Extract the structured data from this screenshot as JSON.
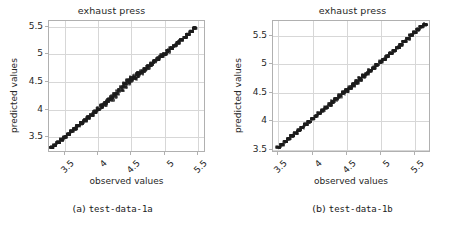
{
  "figure": {
    "background": "#ffffff",
    "panels": [
      {
        "id": "panel-a",
        "title": "exhaust press",
        "xlabel": "observed values",
        "ylabel": "predicted values",
        "caption_marker": "(a)",
        "caption_text": "test-data-1a",
        "xticks": [
          "3.5",
          "4.0",
          "4.5",
          "5.0",
          "5.5"
        ],
        "yticks": [
          "3.5",
          "4.0",
          "4.5",
          "5.0",
          "5.5"
        ]
      },
      {
        "id": "panel-b",
        "title": "exhaust press",
        "xlabel": "observed values",
        "ylabel": "predicted values",
        "caption_marker": "(b)",
        "caption_text": "test-data-1b",
        "xticks": [
          "3.5",
          "4.0",
          "4.5",
          "5.0",
          "5.5"
        ],
        "yticks": [
          "3.5",
          "4.0",
          "4.5",
          "5.0",
          "5.5"
        ]
      }
    ]
  },
  "style": {
    "point_color": "#1c1c1c",
    "grid_color": "#d7d7d7",
    "frame_color": "#b0b0b0",
    "text_color": "#262626"
  },
  "chart_data": [
    {
      "type": "scatter",
      "title": "exhaust press",
      "xlabel": "observed values",
      "ylabel": "predicted values",
      "subplot_label": "(a) test-data-1a",
      "grid": true,
      "legend": null,
      "xlim": [
        3.26,
        5.62
      ],
      "ylim": [
        3.22,
        5.6
      ],
      "xticks": [
        3.5,
        4.0,
        4.5,
        5.0,
        5.5
      ],
      "yticks": [
        3.5,
        4.0,
        4.5,
        5.0,
        5.5
      ],
      "annotation": "Dense near-diagonal point cloud (predicted vs observed) hugging the y=x identity line; band widens noticeably around observed 4.3-4.7.",
      "series": [
        {
          "name": "predicted vs observed",
          "color": "#1c1c1c",
          "x": [
            3.3,
            3.35,
            3.4,
            3.45,
            3.5,
            3.55,
            3.6,
            3.65,
            3.7,
            3.75,
            3.8,
            3.85,
            3.9,
            3.95,
            4.0,
            4.05,
            4.1,
            4.15,
            4.2,
            4.25,
            4.3,
            4.35,
            4.4,
            4.45,
            4.5,
            4.55,
            4.6,
            4.65,
            4.7,
            4.75,
            4.8,
            4.85,
            4.9,
            4.95,
            5.0,
            5.05,
            5.1,
            5.15,
            5.2,
            5.25,
            5.3,
            5.35,
            5.4,
            5.45
          ],
          "y": [
            3.32,
            3.36,
            3.41,
            3.46,
            3.51,
            3.56,
            3.61,
            3.66,
            3.71,
            3.76,
            3.81,
            3.86,
            3.91,
            3.96,
            4.01,
            4.06,
            4.11,
            4.16,
            4.21,
            4.26,
            4.32,
            4.38,
            4.44,
            4.5,
            4.55,
            4.59,
            4.63,
            4.67,
            4.72,
            4.77,
            4.82,
            4.87,
            4.92,
            4.97,
            5.01,
            5.06,
            5.11,
            5.16,
            5.21,
            5.26,
            5.31,
            5.36,
            5.41,
            5.47
          ]
        }
      ]
    },
    {
      "type": "scatter",
      "title": "exhaust press",
      "xlabel": "observed values",
      "ylabel": "predicted values",
      "subplot_label": "(b) test-data-1b",
      "grid": true,
      "legend": null,
      "xlim": [
        3.42,
        5.74
      ],
      "ylim": [
        3.44,
        5.76
      ],
      "xticks": [
        3.5,
        4.0,
        4.5,
        5.0,
        5.5
      ],
      "yticks": [
        3.5,
        4.0,
        4.5,
        5.0,
        5.5
      ],
      "annotation": "Dense near-diagonal point cloud (predicted vs observed) tightly following the y=x identity line across the full range.",
      "series": [
        {
          "name": "predicted vs observed",
          "color": "#1c1c1c",
          "x": [
            3.5,
            3.55,
            3.6,
            3.65,
            3.7,
            3.75,
            3.8,
            3.85,
            3.9,
            3.95,
            4.0,
            4.05,
            4.1,
            4.15,
            4.2,
            4.25,
            4.3,
            4.35,
            4.4,
            4.45,
            4.5,
            4.55,
            4.6,
            4.65,
            4.7,
            4.75,
            4.8,
            4.85,
            4.9,
            4.95,
            5.0,
            5.05,
            5.1,
            5.15,
            5.2,
            5.25,
            5.3,
            5.35,
            5.4,
            5.45,
            5.5,
            5.55,
            5.6,
            5.65
          ],
          "y": [
            3.54,
            3.59,
            3.64,
            3.69,
            3.74,
            3.79,
            3.84,
            3.89,
            3.94,
            3.99,
            4.04,
            4.09,
            4.14,
            4.19,
            4.24,
            4.29,
            4.34,
            4.39,
            4.44,
            4.49,
            4.54,
            4.59,
            4.64,
            4.69,
            4.74,
            4.79,
            4.84,
            4.89,
            4.94,
            4.99,
            5.04,
            5.09,
            5.14,
            5.19,
            5.24,
            5.29,
            5.34,
            5.4,
            5.45,
            5.51,
            5.56,
            5.61,
            5.66,
            5.7
          ]
        }
      ]
    }
  ]
}
